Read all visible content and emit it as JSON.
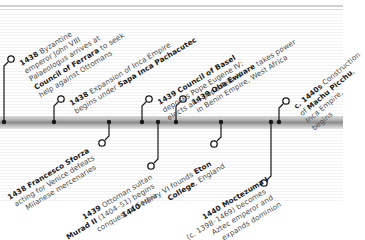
{
  "timeline": {
    "bar_color": "#8c8c8c",
    "connector_color": "#1a1a1a",
    "events_above": [
      {
        "id": "byzantine",
        "year": "1438",
        "lines": [
          {
            "pre": "",
            "bold": "1438",
            "post": " Byzantine"
          },
          {
            "pre": "emperor John VIII",
            "bold": "",
            "post": ""
          },
          {
            "pre": "Palaeologus arrives at",
            "bold": "",
            "post": ""
          },
          {
            "pre": "",
            "bold": "Council of Ferrara",
            "post": " to seek"
          },
          {
            "pre": "help against Ottomans",
            "bold": "",
            "post": ""
          }
        ]
      },
      {
        "id": "inca-expansion",
        "year": "1438",
        "lines": [
          {
            "pre": "",
            "bold": "1438",
            "post": " Expansion of Inca Empire"
          },
          {
            "pre": "begins under ",
            "bold": "Sapa Inca Pachacutec",
            "post": ""
          }
        ]
      },
      {
        "id": "council-basel",
        "year": "1439",
        "lines": [
          {
            "pre": "",
            "bold": "1439 Council of Basel",
            "post": ""
          },
          {
            "pre": "deposes Pope Eugene IV;",
            "bold": "",
            "post": ""
          },
          {
            "pre": "elects anti-pope Felix V",
            "bold": "",
            "post": ""
          }
        ]
      },
      {
        "id": "oba-ewuare",
        "year": "1439",
        "lines": [
          {
            "pre": "",
            "bold": "1439 Oba Ewuare",
            "post": " takes power"
          },
          {
            "pre": "in Benin Empire, West Africa",
            "bold": "",
            "post": ""
          }
        ]
      },
      {
        "id": "machu-picchu",
        "year": "c. 1440s",
        "lines": [
          {
            "pre": "",
            "bold": "c. 1440s",
            "post": " Construction"
          },
          {
            "pre": "of ",
            "bold": "Machu Picchu",
            "post": ","
          },
          {
            "pre": "Inca Empire,",
            "bold": "",
            "post": ""
          },
          {
            "pre": "begins",
            "bold": "",
            "post": ""
          }
        ]
      }
    ],
    "events_below": [
      {
        "id": "francesco-sforza",
        "year": "1438",
        "lines": [
          {
            "pre": "",
            "bold": "1438 Francesco Sforza",
            "post": ""
          },
          {
            "pre": "acting for Venice defeats",
            "bold": "",
            "post": ""
          },
          {
            "pre": "Milanese mercenaries",
            "bold": "",
            "post": ""
          }
        ]
      },
      {
        "id": "murad-ii",
        "year": "1439",
        "lines": [
          {
            "pre": "",
            "bold": "1439",
            "post": " Ottoman sultan"
          },
          {
            "pre": "",
            "bold": "Murad II",
            "post": " (1404–51) begins"
          },
          {
            "pre": "conquest of Serbia",
            "bold": "",
            "post": ""
          }
        ]
      },
      {
        "id": "eton-college",
        "year": "1440",
        "lines": [
          {
            "pre": "",
            "bold": "1440",
            "post": " Henry VI founds "
          },
          {
            "pre": "",
            "bold": "College",
            "post": ", England"
          }
        ],
        "bold_tail_line0": "Eton"
      },
      {
        "id": "moctezuma",
        "year": "1440",
        "lines": [
          {
            "pre": "",
            "bold": "1440 Moctezuma I",
            "post": ""
          },
          {
            "pre": "(c. 1398–1469) becomes",
            "bold": "",
            "post": ""
          },
          {
            "pre": "Aztec emperor and",
            "bold": "",
            "post": ""
          },
          {
            "pre": "expands dominion",
            "bold": "",
            "post": ""
          }
        ]
      }
    ]
  }
}
